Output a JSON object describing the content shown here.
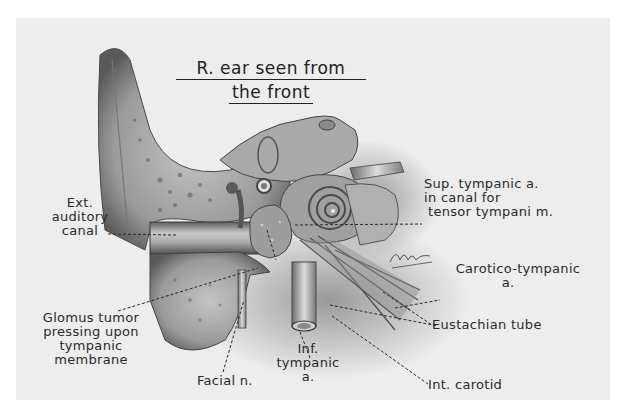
{
  "title": {
    "line1": "R. ear seen from",
    "line2": "the front"
  },
  "labels": {
    "ext_auditory_canal": [
      "Ext.",
      "auditory",
      "canal"
    ],
    "sup_tympanic": [
      "Sup. tympanic a.",
      "in canal for",
      "tensor tympani m."
    ],
    "carotico_tympanic": [
      "Carotico-tympanic",
      "a."
    ],
    "eustachian_tube": "Eustachian tube",
    "int_carotid": "Int. carotid",
    "glomus_tumor": [
      "Glomus tumor",
      "pressing upon",
      "tympanic",
      "membrane"
    ],
    "facial_n": "Facial n.",
    "inf_tympanic": [
      "Inf.",
      "tympanic",
      "a."
    ]
  },
  "signature": "artist signature",
  "colors": {
    "background": "#ffffff",
    "plate": "#ededed",
    "ink": "#2a2a2a",
    "bone_light": "#b8b8b8",
    "bone_dark": "#6e6e6e"
  }
}
